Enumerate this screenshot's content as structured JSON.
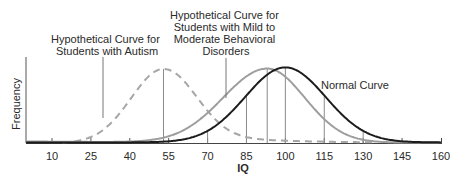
{
  "chart_data": {
    "type": "line",
    "title": "",
    "xlabel": "IQ",
    "ylabel": "Frequency",
    "x_ticks": [
      10,
      25,
      40,
      55,
      70,
      85,
      100,
      115,
      130,
      145,
      160
    ],
    "xlim": [
      0,
      160
    ],
    "grid": false,
    "legend": "inline annotations",
    "series": [
      {
        "name": "Normal Curve",
        "style": "solid",
        "color": "#1a1a1a",
        "mean": 100,
        "sd": 15,
        "x": [
          0,
          10,
          25,
          40,
          55,
          70,
          85,
          100,
          115,
          130,
          145,
          160
        ],
        "y": [
          0.0,
          0.01,
          0.02,
          0.04,
          0.08,
          0.25,
          0.62,
          1.0,
          0.62,
          0.25,
          0.08,
          0.02
        ]
      },
      {
        "name": "Hypothetical Curve for Students with Mild to Moderate Behavioral Disorders",
        "style": "solid",
        "color": "#9a9a9a",
        "mean": 93,
        "x": [
          0,
          10,
          25,
          40,
          55,
          70,
          85,
          93,
          100,
          115,
          130,
          145,
          160
        ],
        "y": [
          0.0,
          0.01,
          0.04,
          0.08,
          0.15,
          0.4,
          0.85,
          1.0,
          0.92,
          0.45,
          0.02,
          0.0,
          0.0
        ]
      },
      {
        "name": "Hypothetical Curve for Students with Autism",
        "style": "dashed",
        "color": "#9a9a9a",
        "mean": 53,
        "x": [
          10,
          25,
          40,
          53,
          60,
          70,
          85,
          100,
          115,
          130,
          145
        ],
        "y": [
          0.0,
          0.32,
          0.75,
          1.0,
          0.86,
          0.55,
          0.13,
          0.07,
          0.04,
          0.01,
          0.0
        ]
      }
    ],
    "vertical_lines_at_iq": [
      55,
      70,
      85,
      93,
      100,
      115,
      130,
      145
    ],
    "annotations": [
      {
        "text": [
          "Hypothetical Curve for",
          "Students with Autism"
        ],
        "points_to": "dashed curve at IQ ~30"
      },
      {
        "text": [
          "Hypothetical Curve for",
          "Students with Mild to",
          "Moderate Behavioral",
          "Disorders"
        ],
        "points_to": "gray curve at IQ ~78"
      },
      {
        "text": [
          "Normal Curve"
        ],
        "points_to": "black curve"
      }
    ]
  },
  "labels": {
    "autism": [
      "Hypothetical Curve for",
      "Students with Autism"
    ],
    "behavioral": [
      "Hypothetical Curve for",
      "Students with Mild to",
      "Moderate Behavioral",
      "Disorders"
    ],
    "normal": "Normal Curve",
    "xlabel": "IQ",
    "ylabel": "Frequency"
  },
  "ticks": [
    "10",
    "25",
    "40",
    "55",
    "70",
    "85",
    "100",
    "115",
    "130",
    "145",
    "160"
  ]
}
